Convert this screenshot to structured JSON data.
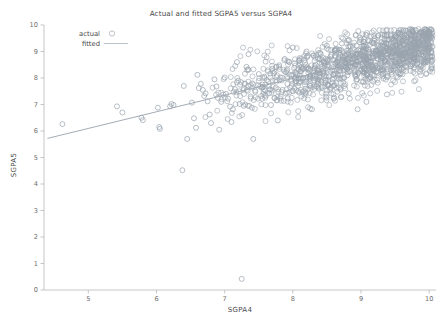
{
  "chart_data": {
    "type": "scatter",
    "title": "Actual and fitted SGPA5 versus SGPA4",
    "xlabel": "SGPA4",
    "ylabel": "SGPA5",
    "xlim": [
      4.35,
      10.1
    ],
    "ylim": [
      0,
      10
    ],
    "xticks": [
      5,
      6,
      7,
      8,
      9,
      10
    ],
    "yticks": [
      0,
      1,
      2,
      3,
      4,
      5,
      6,
      7,
      8,
      9,
      10
    ],
    "xtick_labels": [
      "5",
      "6",
      "7",
      "8",
      "9",
      "10"
    ],
    "ytick_labels": [
      "0",
      "1",
      "2",
      "3",
      "4",
      "5",
      "6",
      "7",
      "8",
      "9",
      "10"
    ],
    "grid": false,
    "legend_position": "top-left",
    "marker": "open-circle",
    "marker_color": "#9aa3ae",
    "line_color": "#9aa3ae",
    "series": [
      {
        "name": "actual",
        "kind": "scatter",
        "points": [
          [
            4.62,
            6.26
          ],
          [
            5.42,
            6.93
          ],
          [
            5.5,
            6.7
          ],
          [
            5.78,
            6.5
          ],
          [
            5.8,
            6.41
          ],
          [
            6.02,
            6.88
          ],
          [
            6.04,
            6.15
          ],
          [
            6.05,
            6.08
          ],
          [
            6.2,
            6.93
          ],
          [
            6.22,
            7.02
          ],
          [
            6.25,
            6.98
          ],
          [
            6.38,
            4.52
          ],
          [
            6.4,
            7.7
          ],
          [
            6.45,
            5.7
          ],
          [
            6.52,
            7.07
          ],
          [
            6.55,
            6.48
          ],
          [
            6.58,
            6.12
          ],
          [
            6.6,
            8.12
          ],
          [
            6.62,
            7.62
          ],
          [
            6.65,
            7.78
          ],
          [
            6.68,
            7.55
          ],
          [
            6.7,
            7.32
          ],
          [
            6.72,
            7.42
          ],
          [
            6.75,
            7.12
          ],
          [
            6.78,
            6.62
          ],
          [
            6.8,
            6.3
          ],
          [
            6.85,
            7.95
          ],
          [
            6.88,
            7.68
          ],
          [
            6.9,
            7.25
          ],
          [
            6.92,
            6.05
          ],
          [
            6.95,
            7.1
          ],
          [
            7.0,
            8.02
          ],
          [
            7.02,
            7.4
          ],
          [
            7.05,
            7.22
          ],
          [
            7.08,
            6.92
          ],
          [
            7.1,
            6.34
          ],
          [
            7.12,
            6.82
          ],
          [
            7.15,
            7.58
          ],
          [
            7.18,
            8.6
          ],
          [
            7.2,
            7.9
          ],
          [
            7.22,
            7.02
          ],
          [
            7.25,
            0.42
          ],
          [
            7.28,
            6.95
          ],
          [
            7.3,
            7.78
          ],
          [
            7.32,
            8.42
          ],
          [
            7.35,
            8.9
          ],
          [
            7.38,
            7.3
          ],
          [
            7.4,
            6.88
          ],
          [
            7.42,
            5.7
          ],
          [
            7.45,
            7.48
          ],
          [
            7.5,
            8.15
          ],
          [
            7.52,
            7.68
          ],
          [
            7.55,
            7.22
          ],
          [
            7.58,
            8.05
          ],
          [
            7.6,
            8.62
          ],
          [
            7.62,
            7.92
          ],
          [
            7.65,
            7.42
          ],
          [
            7.68,
            6.98
          ],
          [
            7.7,
            8.35
          ],
          [
            7.72,
            8.18
          ],
          [
            7.75,
            7.62
          ],
          [
            7.78,
            6.4
          ],
          [
            7.8,
            8.48
          ],
          [
            7.82,
            8.02
          ],
          [
            7.85,
            7.55
          ],
          [
            7.88,
            8.72
          ],
          [
            7.9,
            8.22
          ],
          [
            7.92,
            7.78
          ],
          [
            7.95,
            8.6
          ],
          [
            7.98,
            8.1
          ],
          [
            8.0,
            9.15
          ],
          [
            8.02,
            8.38
          ],
          [
            8.05,
            7.88
          ],
          [
            8.08,
            7.5
          ],
          [
            8.1,
            8.75
          ],
          [
            8.12,
            8.25
          ],
          [
            8.15,
            7.98
          ],
          [
            8.18,
            8.58
          ],
          [
            8.2,
            9.0
          ],
          [
            8.22,
            8.32
          ],
          [
            8.25,
            7.7
          ],
          [
            8.28,
            6.82
          ],
          [
            8.3,
            8.85
          ],
          [
            8.32,
            8.45
          ],
          [
            8.35,
            8.08
          ],
          [
            8.38,
            7.6
          ],
          [
            8.4,
            8.95
          ],
          [
            8.42,
            8.52
          ],
          [
            8.45,
            8.18
          ],
          [
            8.48,
            7.82
          ],
          [
            8.5,
            9.22
          ],
          [
            8.52,
            8.68
          ],
          [
            8.55,
            8.28
          ],
          [
            8.58,
            7.95
          ],
          [
            8.6,
            7.22
          ],
          [
            8.62,
            9.05
          ],
          [
            8.65,
            8.6
          ],
          [
            8.68,
            8.3
          ],
          [
            8.7,
            8.0
          ],
          [
            8.72,
            9.3
          ],
          [
            8.75,
            8.78
          ],
          [
            8.78,
            8.4
          ],
          [
            8.8,
            8.1
          ],
          [
            8.82,
            7.42
          ],
          [
            8.85,
            9.18
          ],
          [
            8.88,
            8.7
          ],
          [
            8.9,
            8.35
          ],
          [
            8.92,
            8.05
          ],
          [
            8.95,
            6.82
          ],
          [
            8.98,
            9.35
          ],
          [
            9.0,
            8.9
          ],
          [
            9.02,
            8.52
          ],
          [
            9.05,
            8.2
          ],
          [
            9.08,
            7.1
          ],
          [
            9.1,
            9.42
          ],
          [
            9.12,
            8.98
          ],
          [
            9.15,
            8.62
          ],
          [
            9.18,
            8.3
          ],
          [
            9.2,
            9.5
          ],
          [
            9.22,
            9.05
          ],
          [
            9.25,
            8.72
          ],
          [
            9.28,
            8.4
          ],
          [
            9.3,
            9.35
          ],
          [
            9.32,
            9.0
          ],
          [
            9.35,
            8.68
          ],
          [
            9.38,
            7.38
          ],
          [
            9.4,
            9.45
          ],
          [
            9.42,
            9.1
          ],
          [
            9.45,
            8.78
          ],
          [
            9.48,
            8.45
          ],
          [
            9.5,
            9.55
          ],
          [
            9.52,
            9.2
          ],
          [
            9.55,
            8.88
          ],
          [
            9.58,
            8.55
          ],
          [
            9.6,
            9.62
          ],
          [
            9.62,
            9.28
          ],
          [
            9.65,
            8.95
          ],
          [
            9.68,
            8.62
          ],
          [
            9.7,
            9.68
          ],
          [
            9.72,
            9.35
          ],
          [
            9.75,
            9.02
          ],
          [
            9.78,
            8.72
          ],
          [
            9.8,
            9.58
          ],
          [
            9.82,
            9.22
          ],
          [
            9.85,
            8.9
          ],
          [
            9.88,
            9.72
          ],
          [
            9.9,
            9.42
          ],
          [
            9.92,
            9.12
          ],
          [
            9.95,
            8.58
          ],
          [
            9.98,
            9.15
          ]
        ]
      },
      {
        "name": "fitted",
        "kind": "line",
        "endpoints": [
          [
            4.4,
            5.72
          ],
          [
            10.05,
            9.27
          ]
        ]
      }
    ],
    "cluster_note": "Dense overplotted band of open circles concentrated between SGPA4 7.5-10 and SGPA5 7.5-9.7, thinning toward lower-left; a few low outliers near (6.4, 4.5) and (7.25, 0.4)."
  },
  "legend": {
    "items": [
      {
        "label": "actual",
        "symbol": "open-circle"
      },
      {
        "label": "fitted",
        "symbol": "line"
      }
    ]
  }
}
